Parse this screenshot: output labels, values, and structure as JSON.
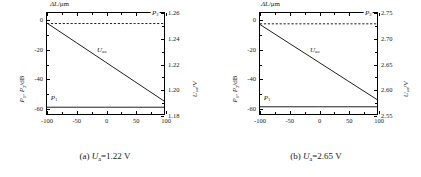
{
  "figure": {
    "panels": [
      {
        "id": "a",
        "caption_prefix": "(a) ",
        "caption_var": "U",
        "caption_sub": "a",
        "caption_value": "=1.22 V",
        "chart_data": {
          "type": "line",
          "title": "",
          "xlabel": "ΔL/μm",
          "ylabel": "P₁, P₂/dB",
          "ylabel_right": "Uₐₒ/V",
          "xlim": [
            -100,
            100
          ],
          "ylim": [
            -65,
            5
          ],
          "ylim_right": [
            1.18,
            1.26
          ],
          "xticks": [
            -100,
            -50,
            0,
            50,
            100
          ],
          "xticklabels": [
            "-100",
            "-50",
            "0",
            "50",
            "100"
          ],
          "yticks": [
            0,
            -20,
            -40,
            -60
          ],
          "yticklabels": [
            "0",
            "-20",
            "-40",
            "-60"
          ],
          "yticks_right": [
            1.26,
            1.24,
            1.22,
            1.2,
            1.18
          ],
          "yticklabels_right": [
            "1.26",
            "1.24",
            "1.22",
            "1.20",
            "1.18"
          ],
          "grid": false,
          "legend": "inline-annotations",
          "series": [
            {
              "name": "U_ao",
              "style": "solid",
              "axis": "left",
              "x": [
                -100,
                -50,
                0,
                50,
                100
              ],
              "values": [
                -2.0,
                -15.5,
                -29.0,
                -42.5,
                -56.0
              ],
              "label": "U",
              "label_sub": "ao"
            },
            {
              "name": "P_2",
              "style": "dashed",
              "axis": "left",
              "x": [
                -100,
                -50,
                0,
                50,
                100
              ],
              "values": [
                -2.3,
                -2.3,
                -2.3,
                -2.3,
                -2.3
              ],
              "label": "P",
              "label_sub": "2"
            },
            {
              "name": "P_1",
              "style": "solid",
              "axis": "left",
              "x": [
                -100,
                -50,
                0,
                50,
                100
              ],
              "values": [
                -60.3,
                -60.3,
                -60.3,
                -60.3,
                -60.3
              ],
              "label": "P",
              "label_sub": "1"
            }
          ]
        }
      },
      {
        "id": "b",
        "caption_prefix": "(b) ",
        "caption_var": "U",
        "caption_sub": "a",
        "caption_value": "=2.65 V",
        "chart_data": {
          "type": "line",
          "title": "",
          "xlabel": "ΔL/μm",
          "ylabel": "P₁, P₂/dB",
          "ylabel_right": "Uₐₒ/V",
          "xlim": [
            -100,
            100
          ],
          "ylim": [
            -65,
            5
          ],
          "ylim_right": [
            2.55,
            2.75
          ],
          "xticks": [
            -100,
            -50,
            0,
            50,
            100
          ],
          "xticklabels": [
            "-100",
            "-50",
            "0",
            "50",
            "100"
          ],
          "yticks": [
            0,
            -20,
            -40,
            -60
          ],
          "yticklabels": [
            "0",
            "-20",
            "-40",
            "-60"
          ],
          "yticks_right": [
            2.75,
            2.7,
            2.65,
            2.6,
            2.55
          ],
          "yticklabels_right": [
            "2.75",
            "2.70",
            "2.65",
            "2.60",
            "2.55"
          ],
          "grid": false,
          "legend": "inline-annotations",
          "series": [
            {
              "name": "U_ao",
              "style": "solid",
              "axis": "left",
              "x": [
                -100,
                -50,
                0,
                50,
                100
              ],
              "values": [
                -3.0,
                -16.0,
                -29.0,
                -42.0,
                -55.0
              ],
              "label": "U",
              "label_sub": "ao"
            },
            {
              "name": "P_2",
              "style": "dashed",
              "axis": "left",
              "x": [
                -100,
                -50,
                0,
                50,
                100
              ],
              "values": [
                -2.5,
                -2.5,
                -2.5,
                -2.5,
                -2.5
              ],
              "label": "P",
              "label_sub": "2"
            },
            {
              "name": "P_1",
              "style": "solid",
              "axis": "left",
              "x": [
                -100,
                -50,
                0,
                50,
                100
              ],
              "values": [
                -60.0,
                -60.0,
                -60.0,
                -60.0,
                -60.0
              ],
              "label": "P",
              "label_sub": "1"
            }
          ]
        }
      }
    ]
  }
}
